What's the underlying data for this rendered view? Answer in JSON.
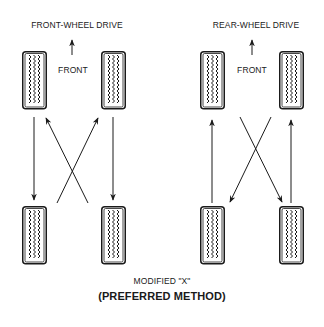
{
  "diagram": {
    "type": "tire-rotation",
    "caption": "MODIFIED \"X\"",
    "subcaption": "(PREFERRED METHOD)",
    "panels": [
      {
        "title": "FRONT-WHEEL DRIVE",
        "direction_label": "FRONT",
        "moves": [
          {
            "from": "front-left",
            "to": "rear-left",
            "style": "straight"
          },
          {
            "from": "front-right",
            "to": "rear-right",
            "style": "straight"
          },
          {
            "from": "rear-left",
            "to": "front-right",
            "style": "cross"
          },
          {
            "from": "rear-right",
            "to": "front-left",
            "style": "cross"
          }
        ]
      },
      {
        "title": "REAR-WHEEL DRIVE",
        "direction_label": "FRONT",
        "moves": [
          {
            "from": "rear-left",
            "to": "front-left",
            "style": "straight"
          },
          {
            "from": "rear-right",
            "to": "front-right",
            "style": "straight"
          },
          {
            "from": "front-left",
            "to": "rear-right",
            "style": "cross"
          },
          {
            "from": "front-right",
            "to": "rear-left",
            "style": "cross"
          }
        ]
      }
    ],
    "colors": {
      "line": "#1a1a1a",
      "background": "#ffffff"
    }
  }
}
